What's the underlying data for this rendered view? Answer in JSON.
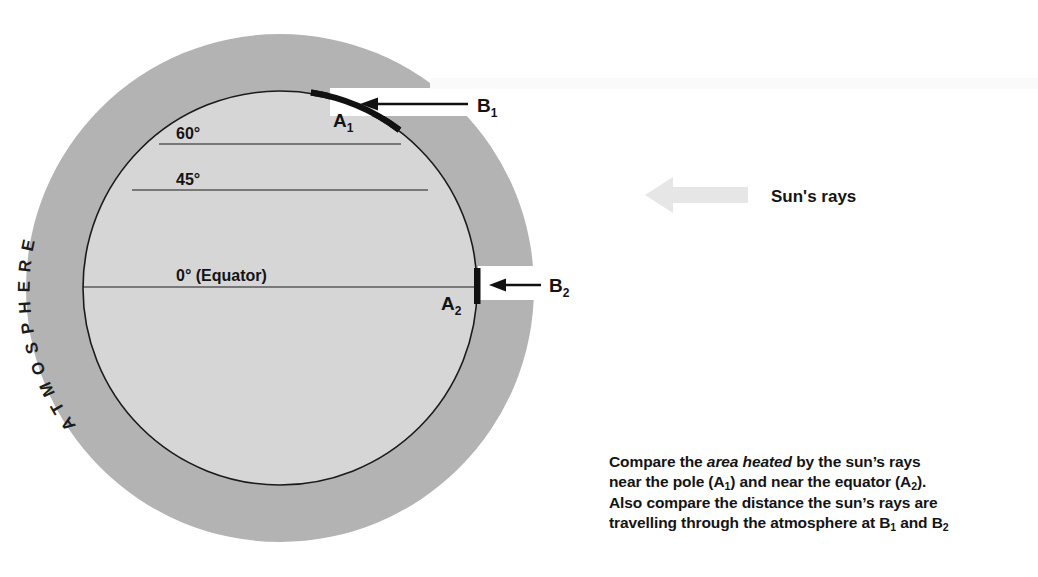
{
  "diagram": {
    "atmosphere_label": "ATMOSPHERE",
    "latitudes": [
      {
        "id": "lat-60",
        "label": "60°",
        "value": 60,
        "y": 144
      },
      {
        "id": "lat-45",
        "label": "45°",
        "value": 45,
        "y": 190
      },
      {
        "id": "lat-0",
        "label": "0° (Equator)",
        "value": 0,
        "y": 287
      }
    ],
    "points": [
      {
        "id": "A1",
        "label": "A",
        "sub": "1",
        "meaning": "area heated near the pole"
      },
      {
        "id": "A2",
        "label": "A",
        "sub": "2",
        "meaning": "area heated near the equator"
      },
      {
        "id": "B1",
        "label": "B",
        "sub": "1",
        "meaning": "ray path through atmosphere near the pole"
      },
      {
        "id": "B2",
        "label": "B",
        "sub": "2",
        "meaning": "ray path through atmosphere at the equator"
      }
    ],
    "sun_rays_label": "Sun's rays",
    "colors": {
      "atmosphere": "#b3b3b3",
      "earth": "#d6d6d6",
      "outline": "#1a1a1a",
      "highlight": "#111111",
      "sun_arrow": "#e8e8e8",
      "background": "#ffffff"
    },
    "geometry": {
      "center_x": 280,
      "center_y": 288,
      "atmosphere_radius": 254,
      "earth_radius": 197
    }
  },
  "caption": {
    "line1_pre": "Compare the ",
    "line1_em": "area heated",
    "line1_post": " by the sun’s rays",
    "line2_a": "near the pole (A",
    "line2_sub1": "1",
    "line2_b": ") and near the equator (A",
    "line2_sub2": "2",
    "line2_c": ").",
    "line3": "Also compare the distance the sun’s rays are",
    "line4_a": "travelling through the atmosphere at B",
    "line4_sub1": "1",
    "line4_b": " and B",
    "line4_sub2": "2"
  }
}
